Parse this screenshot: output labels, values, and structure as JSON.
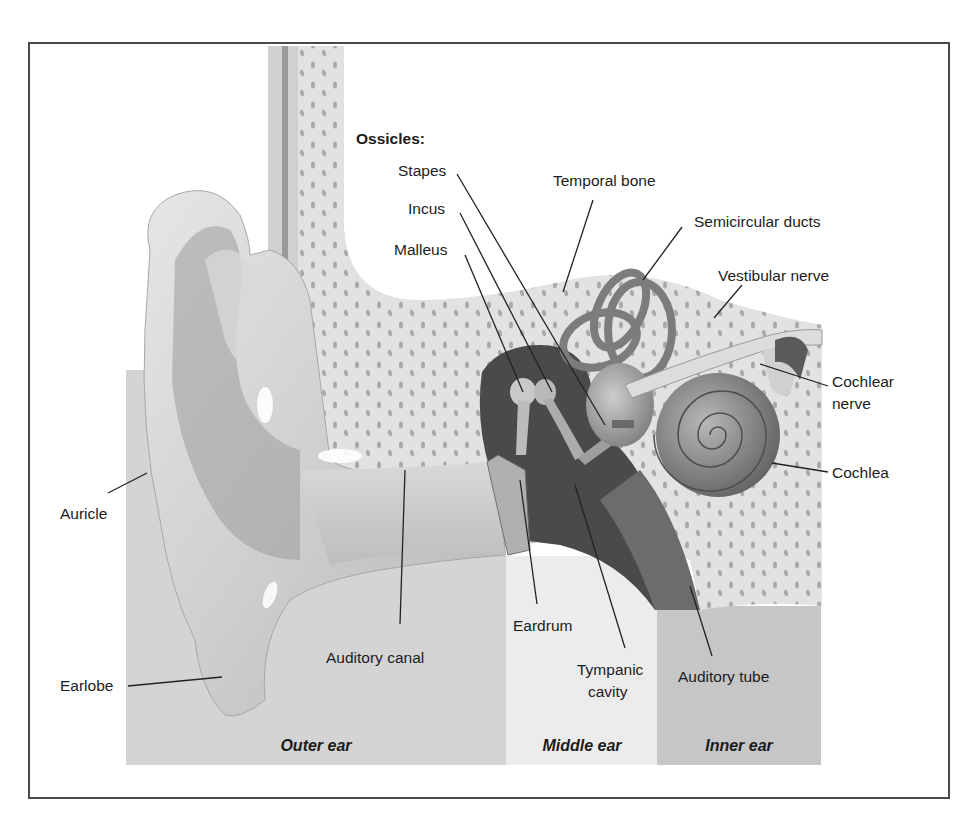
{
  "diagram": {
    "ossicles_heading": "Ossicles:",
    "labels": {
      "stapes": "Stapes",
      "incus": "Incus",
      "malleus": "Malleus",
      "temporal_bone": "Temporal bone",
      "semicircular_ducts": "Semicircular ducts",
      "vestibular_nerve": "Vestibular nerve",
      "cochlear_nerve_line1": "Cochlear",
      "cochlear_nerve_line2": "nerve",
      "cochlea": "Cochlea",
      "auricle": "Auricle",
      "earlobe": "Earlobe",
      "auditory_canal": "Auditory canal",
      "eardrum": "Eardrum",
      "tympanic_cavity_line1": "Tympanic",
      "tympanic_cavity_line2": "cavity",
      "auditory_tube": "Auditory tube"
    },
    "sections": [
      {
        "label": "Outer ear",
        "color": "#d4d4d4"
      },
      {
        "label": "Middle ear",
        "color": "#ececec"
      },
      {
        "label": "Inner ear",
        "color": "#c6c6c6"
      }
    ],
    "colors": {
      "bone": "#e2e2e2",
      "bone_dots": "#a4a4a4",
      "ear_skin": "#c8c8c8",
      "cavity": "#4a4a4a",
      "inner_organs": "#8c8c8c",
      "frame_border": "#4a4a4a"
    }
  }
}
